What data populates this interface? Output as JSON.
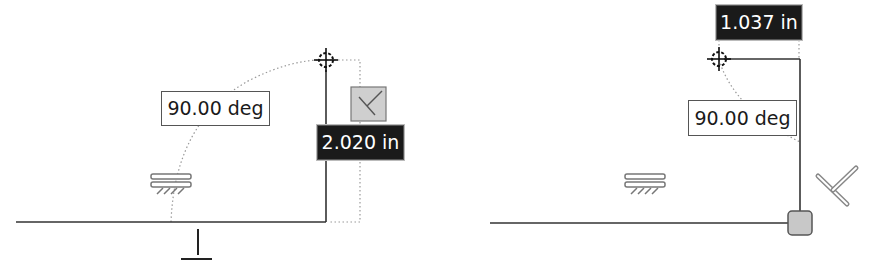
{
  "left_panel": {
    "angle_label": "90.00 deg",
    "length_label": "2.020 in",
    "constraint_icons": [
      "horizontal-constraint-icon",
      "perpendicular-constraint-icon",
      "ground-icon",
      "cursor-target-icon"
    ]
  },
  "right_panel": {
    "angle_label": "90.00 deg",
    "length_label": "1.037 in",
    "constraint_icons": [
      "horizontal-constraint-icon",
      "perpendicular-constraint-icon",
      "endpoint-handle-icon",
      "cursor-target-icon"
    ]
  },
  "colors": {
    "line": "#333333",
    "dotted": "#999999",
    "dark_label_bg": "#1a1a1a",
    "handle_fill": "#c8c8c8"
  }
}
